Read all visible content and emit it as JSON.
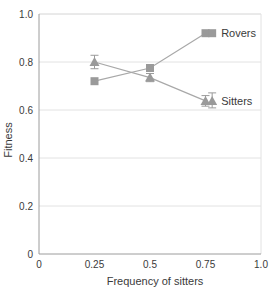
{
  "chart_data": {
    "type": "line",
    "title": "",
    "subtitle": "",
    "xlabel": "Frequency of sitters",
    "ylabel": "Fitness",
    "xlim": [
      0,
      1.0
    ],
    "ylim": [
      0,
      1.0
    ],
    "xticks": [
      "0",
      "0.25",
      "0.5",
      "0.75",
      "1.0"
    ],
    "xtick_values": [
      0,
      0.25,
      0.5,
      0.75,
      1.0
    ],
    "yticks": [
      "0",
      "0.2",
      "0.4",
      "0.6",
      "0.8",
      "1.0"
    ],
    "ytick_values": [
      0,
      0.2,
      0.4,
      0.6,
      0.8,
      1.0
    ],
    "grid": "horizontal",
    "legend_position": "inline-right",
    "x": [
      0.25,
      0.5,
      0.75
    ],
    "series": [
      {
        "name": "Rovers",
        "marker": "square",
        "color": "#9a9a9a",
        "values": [
          0.72,
          0.775,
          0.92
        ],
        "errors": [
          0.0,
          0.0,
          0.0
        ],
        "label": "Rovers",
        "label_x": 0.78,
        "label_y": 0.92
      },
      {
        "name": "Sitters",
        "marker": "triangle",
        "color": "#9a9a9a",
        "values": [
          0.8,
          0.735,
          0.638
        ],
        "errors": [
          0.028,
          0.017,
          0.022
        ],
        "label": "Sitters",
        "label_x": 0.78,
        "label_y": 0.638
      }
    ],
    "colors": {
      "marker": "#9a9a9a",
      "line": "#a8a8a8",
      "grid": "#e2e2e2",
      "axis": "#9c9c9c",
      "text": "#3a3a3a"
    }
  }
}
